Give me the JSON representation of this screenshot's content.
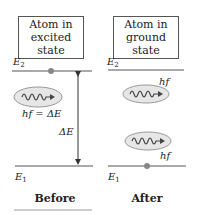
{
  "before": {
    "box_line1": "Atom in",
    "box_line2": "excited state",
    "upper_level": "E",
    "upper_sub": "2",
    "lower_level": "E",
    "lower_sub": "1",
    "photon_label": "hf = ΔE",
    "gap_label": "ΔE",
    "caption": "Before"
  },
  "after": {
    "box_line1": "Atom in",
    "box_line2": "ground state",
    "upper_level": "E",
    "upper_sub": "2",
    "lower_level": "E",
    "lower_sub": "1",
    "photon1_label": "hf",
    "photon2_label": "hf",
    "caption": "After"
  },
  "colors": {
    "line": "#555555",
    "dot": "#888888",
    "ellipse_fill": "#e6e6e6",
    "ellipse_stroke": "#999999"
  }
}
